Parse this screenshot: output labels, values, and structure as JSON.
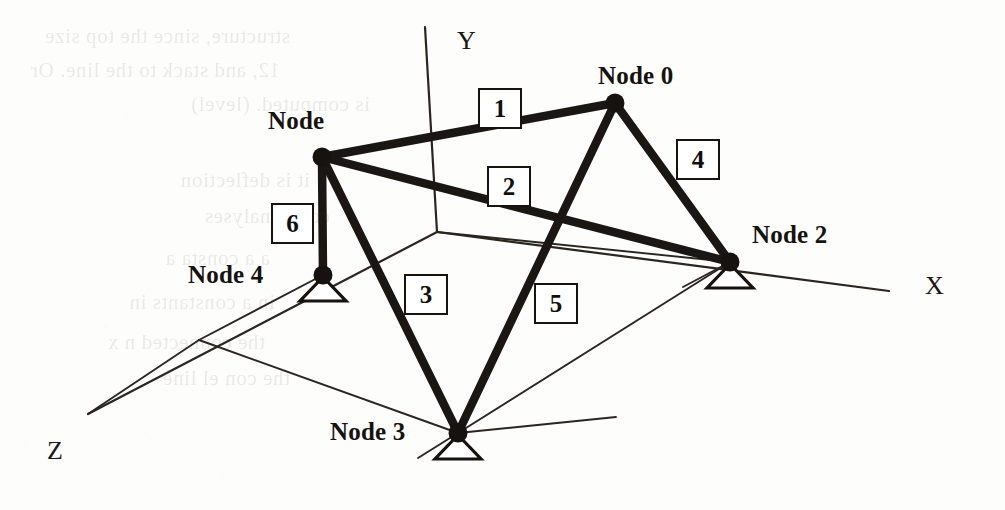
{
  "figure": {
    "caption": "",
    "axes": [
      {
        "id": "y-axis",
        "label": "Y",
        "x1": 425,
        "y1": 27,
        "x2": 437,
        "y2": 232,
        "label_x": 457,
        "label_y": 28
      },
      {
        "id": "x-axis",
        "label": "X",
        "x1": 437,
        "y1": 232,
        "x2": 889,
        "y2": 291,
        "label_x": 925,
        "label_y": 273
      },
      {
        "id": "z-axis",
        "label": "Z",
        "x1": 437,
        "y1": 232,
        "x2": 88,
        "y2": 414,
        "label_x": 47,
        "label_y": 438
      }
    ],
    "nodes": [
      {
        "id": "node-0",
        "label": "Node 0",
        "x": 615,
        "y": 103,
        "label_x": 598,
        "label_y": 63,
        "support": false
      },
      {
        "id": "node-1",
        "label": "Node",
        "x": 322,
        "y": 157,
        "label_x": 268,
        "label_y": 108,
        "support": false
      },
      {
        "id": "node-2",
        "label": "Node 2",
        "x": 730,
        "y": 262,
        "label_x": 752,
        "label_y": 222,
        "support": true
      },
      {
        "id": "node-3",
        "label": "Node 3",
        "x": 458,
        "y": 433,
        "label_x": 330,
        "label_y": 419,
        "support": true
      },
      {
        "id": "node-4",
        "label": "Node 4",
        "x": 323,
        "y": 275,
        "label_x": 188,
        "label_y": 262,
        "support": true
      }
    ],
    "elements": [
      {
        "id": "element-1",
        "label": "1",
        "from": "node-1",
        "to": "node-0",
        "box_x": 478,
        "box_y": 88,
        "box_w": 40,
        "box_h": 37
      },
      {
        "id": "element-2",
        "label": "2",
        "from": "node-1",
        "to": "node-2",
        "box_x": 487,
        "box_y": 166,
        "box_w": 40,
        "box_h": 37
      },
      {
        "id": "element-3",
        "label": "3",
        "from": "node-1",
        "to": "node-3",
        "box_x": 404,
        "box_y": 274,
        "box_w": 40,
        "box_h": 37
      },
      {
        "id": "element-4",
        "label": "4",
        "from": "node-0",
        "to": "node-2",
        "box_x": 676,
        "box_y": 139,
        "box_w": 40,
        "box_h": 37
      },
      {
        "id": "element-5",
        "label": "5",
        "from": "node-0",
        "to": "node-3",
        "box_x": 534,
        "box_y": 283,
        "box_w": 40,
        "box_h": 37
      },
      {
        "id": "element-6",
        "label": "6",
        "from": "node-1",
        "to": "node-4",
        "box_x": 271,
        "box_y": 203,
        "box_w": 39,
        "box_h": 37
      }
    ],
    "projection_lines": [
      {
        "id": "proj-node4-ground",
        "x1": 323,
        "y1": 275,
        "x2": 199,
        "y2": 340
      },
      {
        "id": "proj-ground-to-z",
        "x1": 199,
        "y1": 340,
        "x2": 88,
        "y2": 414
      },
      {
        "id": "proj-ground-to-n3",
        "x1": 199,
        "y1": 340,
        "x2": 458,
        "y2": 433
      },
      {
        "id": "proj-n3-to-right",
        "x1": 458,
        "y1": 433,
        "x2": 616,
        "y2": 417
      },
      {
        "id": "proj-n3-diag-up",
        "x1": 458,
        "y1": 433,
        "x2": 730,
        "y2": 262
      },
      {
        "id": "proj-n3-diag-down",
        "x1": 458,
        "y1": 433,
        "x2": 418,
        "y2": 458
      },
      {
        "id": "proj-origin-to-n2",
        "x1": 437,
        "y1": 232,
        "x2": 730,
        "y2": 262
      },
      {
        "id": "proj-n2-down-left",
        "x1": 730,
        "y1": 262,
        "x2": 683,
        "y2": 287
      }
    ],
    "colors": {
      "ink": "#15120f",
      "member": "#1a1613",
      "thin_line": "#2b2521",
      "paper": "#fdfdfc"
    }
  },
  "bleed_through": {
    "note": "faint mirrored text showing through from the reverse side of the scanned page",
    "lines": [
      {
        "text": "structure, since the top size",
        "x": 40,
        "y": 24
      },
      {
        "text": "12, and stack to the line. Or",
        "x": 30,
        "y": 58
      },
      {
        "text": "is computed.  (level)",
        "x": 120,
        "y": 92
      },
      {
        "text": "it is deflection",
        "x": 60,
        "y": 168
      },
      {
        "text": "com,  analyses",
        "x": 80,
        "y": 204
      },
      {
        "text": "a  a consta  a",
        "x": 20,
        "y": 246
      },
      {
        "text": "in  a  constants  in",
        "x": 25,
        "y": 290
      },
      {
        "text": "the connected  n   x",
        "x": 15,
        "y": 330
      },
      {
        "text": "the  con  el  line",
        "x": 40,
        "y": 366
      }
    ]
  }
}
